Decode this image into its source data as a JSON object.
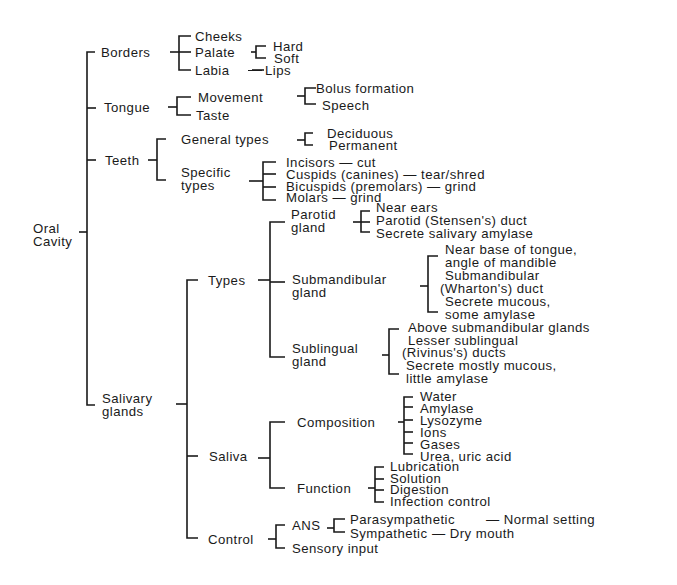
{
  "diagram": {
    "root": "Oral Cavity",
    "root_lines": [
      "Oral",
      "Cavity"
    ],
    "borders": {
      "label": "Borders",
      "cheeks": "Cheeks",
      "palate": "Palate",
      "hard": "Hard",
      "soft": "Soft",
      "labia": "Labia",
      "lips": "Lips"
    },
    "tongue": {
      "label": "Tongue",
      "movement": "Movement",
      "bolus": "Bolus formation",
      "speech": "Speech",
      "taste": "Taste"
    },
    "teeth": {
      "label": "Teeth",
      "general_types": "General types",
      "deciduous": "Deciduous",
      "permanent": "Permanent",
      "specific_types_l1": "Specific",
      "specific_types_l2": "types",
      "incisors": "Incisors — cut",
      "cuspids": "Cuspids (canines) — tear/shred",
      "bicuspids": "Bicuspids (premolars) — grind",
      "molars": "Molars — grind"
    },
    "salivary": {
      "label_l1": "Salivary",
      "label_l2": "glands",
      "types": {
        "label": "Types",
        "parotid_l1": "Parotid",
        "parotid_l2": "gland",
        "parotid_items": [
          "Near ears",
          "Parotid (Stensen's) duct",
          "Secrete salivary amylase"
        ],
        "submandibular_l1": "Submandibular",
        "submandibular_l2": "gland",
        "submandibular_items": [
          "Near base of tongue,",
          "angle of mandible",
          "Submandibular",
          "(Wharton's) duct",
          "Secrete mucous,",
          "some amylase"
        ],
        "sublingual_l1": "Sublingual",
        "sublingual_l2": "gland",
        "sublingual_items": [
          "Above submandibular glands",
          "Lesser sublingual",
          "(Rivinus's) ducts",
          "Secrete mostly mucous,",
          "little amylase"
        ]
      },
      "saliva": {
        "label": "Saliva",
        "composition": "Composition",
        "composition_items": [
          "Water",
          "Amylase",
          "Lysozyme",
          "Ions",
          "Gases",
          "Urea, uric acid"
        ],
        "function": "Function",
        "function_items": [
          "Lubrication",
          "Solution",
          "Digestion",
          "Infection control"
        ]
      },
      "control": {
        "label": "Control",
        "ans": "ANS",
        "parasympathetic": "Parasympathetic",
        "normal_setting": "— Normal setting",
        "sympathetic": "Sympathetic",
        "dry_mouth": "— Dry mouth",
        "sensory_input": "Sensory input"
      }
    }
  }
}
